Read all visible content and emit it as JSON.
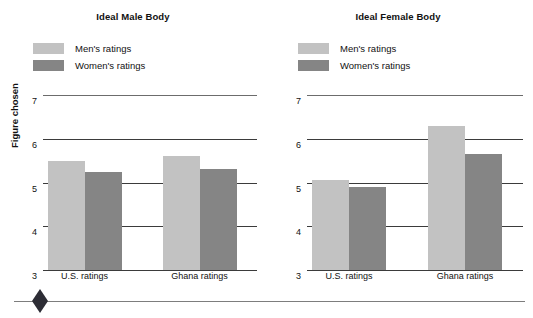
{
  "chart_data": [
    {
      "type": "bar",
      "title": "Ideal Male Body",
      "xlabel": "",
      "ylabel": "Figure chosen",
      "categories": [
        "U.S. ratings",
        "Ghana ratings"
      ],
      "series": [
        {
          "name": "Men's ratings",
          "values": [
            5.5,
            5.6
          ],
          "color": "#c2c2c2"
        },
        {
          "name": "Women's ratings",
          "values": [
            5.25,
            5.3
          ],
          "color": "#858585"
        }
      ],
      "ylim": [
        3,
        7
      ],
      "yticks": [
        7,
        6,
        5,
        4,
        3
      ],
      "grid": true,
      "legend_position": "top-left"
    },
    {
      "type": "bar",
      "title": "Ideal Female Body",
      "xlabel": "",
      "ylabel": "",
      "categories": [
        "U.S. ratings",
        "Ghana ratings"
      ],
      "series": [
        {
          "name": "Men's ratings",
          "values": [
            5.05,
            6.3
          ],
          "color": "#c2c2c2"
        },
        {
          "name": "Women's ratings",
          "values": [
            4.9,
            5.65
          ],
          "color": "#858585"
        }
      ],
      "ylim": [
        3,
        7
      ],
      "yticks": [
        7,
        6,
        5,
        4,
        3
      ],
      "grid": true,
      "legend_position": "top-left"
    }
  ],
  "panels": [
    {
      "title": "Ideal Male Body",
      "axis_label": "Figure chosen",
      "legend": [
        {
          "label": "Men's ratings",
          "color": "#c2c2c2"
        },
        {
          "label": "Women's ratings",
          "color": "#858585"
        }
      ],
      "yticks": [
        "7",
        "6",
        "5",
        "4",
        "3"
      ],
      "xticks": [
        "U.S. ratings",
        "Ghana ratings"
      ]
    },
    {
      "title": "Ideal Female Body",
      "axis_label": "",
      "legend": [
        {
          "label": "Men's ratings",
          "color": "#c2c2c2"
        },
        {
          "label": "Women's ratings",
          "color": "#858585"
        }
      ],
      "yticks": [
        "7",
        "6",
        "5",
        "4",
        "3"
      ],
      "xticks": [
        "U.S. ratings",
        "Ghana ratings"
      ]
    }
  ],
  "colors": {
    "light_bar": "#c2c2c2",
    "dark_bar": "#858585",
    "gridline": "#3b3b3b",
    "footer_rule": "#7d7d7d",
    "diamond": "#2d2d35"
  }
}
